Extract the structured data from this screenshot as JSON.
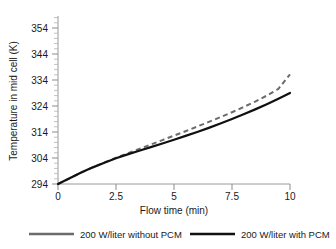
{
  "chart_data": {
    "type": "line",
    "title": "",
    "xlabel": "Flow time (min)",
    "ylabel": "Temperature in mid  cell (K)",
    "xlim": [
      0,
      10
    ],
    "ylim": [
      294,
      358
    ],
    "xticks": [
      "0",
      "2.5",
      "5",
      "7.5",
      "10"
    ],
    "xtick_values": [
      0,
      2.5,
      5,
      7.5,
      10
    ],
    "yticks": [
      "294",
      "304",
      "314",
      "324",
      "334",
      "344",
      "354"
    ],
    "ytick_values": [
      294,
      304,
      314,
      324,
      334,
      344,
      354
    ],
    "y_minor_step": 2,
    "grid": false,
    "legend_position": "bottom",
    "series": [
      {
        "name": "200 W/liter without PCM",
        "style": "dashed",
        "color": "#6b6b6b",
        "x": [
          0,
          0.5,
          1,
          1.5,
          2,
          2.5,
          3,
          3.5,
          4,
          4.5,
          5,
          5.5,
          6,
          6.5,
          7,
          7.5,
          8,
          8.5,
          9,
          9.5,
          10
        ],
        "values": [
          294,
          296.2,
          298.4,
          300.4,
          302.3,
          304.1,
          305.8,
          307.5,
          309.2,
          310.9,
          312.6,
          314.3,
          316.1,
          317.9,
          319.7,
          321.6,
          323.6,
          325.7,
          328.0,
          330.6,
          336.2
        ]
      },
      {
        "name": "200 W/liter with PCM",
        "style": "solid",
        "color": "#111111",
        "x": [
          0,
          0.5,
          1,
          1.5,
          2,
          2.5,
          3,
          3.5,
          4,
          4.5,
          5,
          5.5,
          6,
          6.5,
          7,
          7.5,
          8,
          8.5,
          9,
          9.5,
          10
        ],
        "values": [
          294,
          296.2,
          298.4,
          300.4,
          302.2,
          303.9,
          305.4,
          306.8,
          308.2,
          309.6,
          311.0,
          312.5,
          314.0,
          315.6,
          317.3,
          319.0,
          320.8,
          322.7,
          324.7,
          326.8,
          329.0
        ]
      }
    ]
  },
  "axes": {
    "y_title": "Temperature in mid  cell (K)",
    "x_title": "Flow time (min)"
  },
  "legend": {
    "items": [
      {
        "label": "200 W/liter without PCM",
        "color": "#6b6b6b"
      },
      {
        "label": "200 W/liter with PCM",
        "color": "#111111"
      }
    ]
  }
}
